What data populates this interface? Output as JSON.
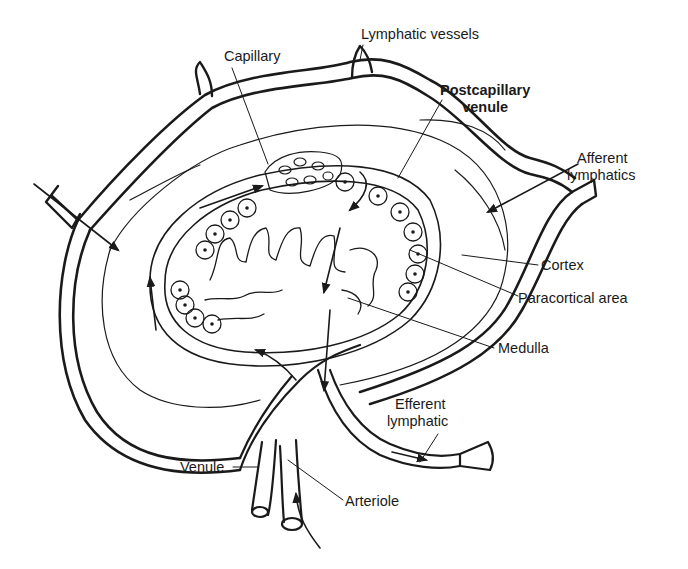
{
  "diagram": {
    "labels": {
      "capillary": "Capillary",
      "lymphatic_vessels": "Lymphatic vessels",
      "postcapillary_venule_line1": "Postcapillary",
      "postcapillary_venule_line2": "venule",
      "afferent_line1": "Afferent",
      "afferent_line2": "lymphatics",
      "cortex": "Cortex",
      "paracortical_area": "Paracortical area",
      "medulla": "Medulla",
      "efferent_line1": "Efferent",
      "efferent_line2": "lymphatic",
      "venule": "Venule",
      "arteriole": "Arteriole"
    },
    "colors": {
      "line": "#1a1a1a",
      "background": "#ffffff"
    }
  }
}
